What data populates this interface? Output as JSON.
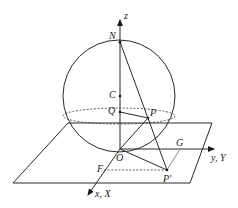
{
  "diagram": {
    "type": "stereographic-projection",
    "colors": {
      "stroke": "#2a2a2a",
      "background": "#ffffff"
    },
    "labels": {
      "z_axis": "z",
      "y_axis": "y, Y",
      "x_axis": "x, X",
      "N": "N",
      "C": "C",
      "Q": "Q",
      "P": "P",
      "O": "O",
      "F": "F",
      "G": "G",
      "P_prime": "P′"
    },
    "points": {
      "N": [
        119,
        42
      ],
      "C": [
        119,
        96
      ],
      "Q": [
        119,
        112
      ],
      "P": [
        148,
        118
      ],
      "O": [
        120,
        149
      ],
      "F": [
        104,
        170
      ],
      "G": [
        180,
        142
      ],
      "P_prime": [
        167,
        170
      ]
    }
  }
}
